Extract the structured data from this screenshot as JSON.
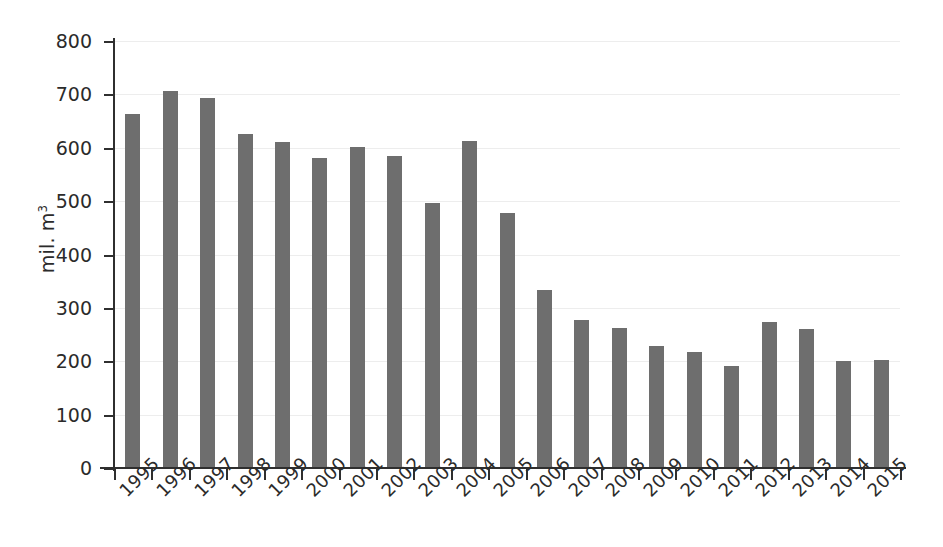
{
  "chart_data": {
    "type": "bar",
    "title": "",
    "subtitle": "",
    "xlabel": "",
    "ylabel": "mil. m3",
    "ylabel_text": "mil. m",
    "ylabel_sup": "3",
    "ylim": [
      0,
      800
    ],
    "ytick_values": [
      0,
      100,
      200,
      300,
      400,
      500,
      600,
      700,
      800
    ],
    "ytick_labels": [
      "0",
      "100",
      "200",
      "300",
      "400",
      "500",
      "600",
      "700",
      "800"
    ],
    "grid": true,
    "legend": null,
    "legend_position": "none",
    "bar_color": "#6e6e6e",
    "background_color": "#ffffff",
    "axis_color": "#2f2f2f",
    "gridline_color": "#ededed",
    "categories": [
      "1995",
      "1996",
      "1997",
      "1998",
      "1999",
      "2000",
      "2001",
      "2002",
      "2003",
      "2004",
      "2005",
      "2006",
      "2007",
      "2008",
      "2009",
      "2010",
      "2011",
      "2012",
      "2013",
      "2014",
      "2015"
    ],
    "values": [
      663,
      706,
      694,
      625,
      611,
      581,
      601,
      584,
      496,
      612,
      477,
      334,
      277,
      262,
      229,
      218,
      191,
      274,
      261,
      200,
      202
    ],
    "series": [
      {
        "name": "mil. m3",
        "values": [
          663,
          706,
          694,
          625,
          611,
          581,
          601,
          584,
          496,
          612,
          477,
          334,
          277,
          262,
          229,
          218,
          191,
          274,
          261,
          200,
          202
        ]
      }
    ]
  }
}
